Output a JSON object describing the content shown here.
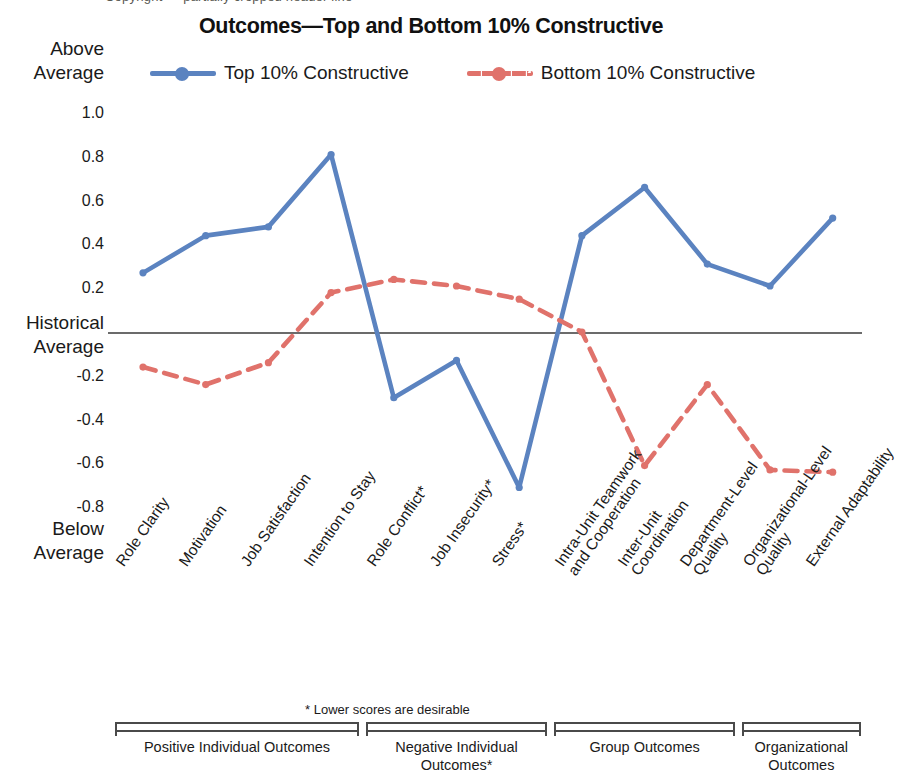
{
  "top_cut_text": "Copyright — partially cropped header line",
  "title": "Outcomes—Top and Bottom 10% Constructive",
  "legend": {
    "position": "top",
    "items": [
      {
        "label": "Top 10% Constructive",
        "color": "#5b83c0",
        "style": "solid",
        "marker": "circle"
      },
      {
        "label": "Bottom 10% Constructive",
        "color": "#e0726b",
        "style": "dashed",
        "marker": "circle"
      }
    ]
  },
  "axis": {
    "y_top_label": "Above\nAverage",
    "y_top_line1": "Above",
    "y_top_line2": "Average",
    "y_zero_line1": "Historical",
    "y_zero_line2": "Average",
    "y_bottom_line1": "Below",
    "y_bottom_line2": "Average",
    "ticks": [
      "1.0",
      "0.8",
      "0.6",
      "0.4",
      "0.2",
      "-0.2",
      "-0.4",
      "-0.6",
      "-0.8"
    ]
  },
  "footnote": "* Lower scores are desirable",
  "groups": [
    {
      "label": "Positive Individual Outcomes",
      "start": 0,
      "end": 3
    },
    {
      "label": "Negative Individual\nOutcomes*",
      "line1": "Negative Individual",
      "line2": "Outcomes*",
      "start": 4,
      "end": 6
    },
    {
      "label": "Group Outcomes",
      "start": 7,
      "end": 9
    },
    {
      "label": "Organizational\nOutcomes",
      "line1": "Organizational",
      "line2": "Outcomes",
      "start": 10,
      "end": 11
    }
  ],
  "chart_data": {
    "type": "line",
    "title": "Outcomes—Top and Bottom 10% Constructive",
    "xlabel": "",
    "ylabel": "Historical Average (standardized score)",
    "ylim": [
      -0.8,
      1.0
    ],
    "ytick_step": 0.2,
    "grid": false,
    "legend_position": "top",
    "zero_reference_line": 0,
    "categories": [
      "Role Clarity",
      "Motivation",
      "Job Satisfaction",
      "Intention to Stay",
      "Role Conflict*",
      "Job Insecurity*",
      "Stress*",
      "Intra-Unit Teamwork\nand Cooperation",
      "Inter-Unit\nCoordination",
      "Department-Level\nQuality",
      "Organizational-Level\nQuality",
      "External Adaptability"
    ],
    "series": [
      {
        "name": "Top 10% Constructive",
        "color": "#5b83c0",
        "style": "solid",
        "values": [
          0.27,
          0.44,
          0.48,
          0.81,
          -0.3,
          -0.13,
          -0.71,
          0.44,
          0.66,
          0.31,
          0.21,
          0.52
        ]
      },
      {
        "name": "Bottom 10% Constructive",
        "color": "#e0726b",
        "style": "dashed",
        "values": [
          -0.16,
          -0.24,
          -0.14,
          0.18,
          0.24,
          0.21,
          0.15,
          0.0,
          -0.61,
          -0.24,
          -0.63,
          -0.64
        ]
      }
    ]
  }
}
